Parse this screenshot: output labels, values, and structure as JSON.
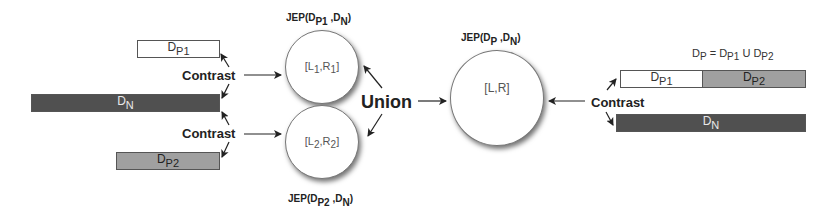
{
  "diagram": {
    "type": "process-flow",
    "left_datasets": {
      "dp1": {
        "base": "D",
        "sub": "P1",
        "fill": "#ffffff"
      },
      "dn": {
        "base": "D",
        "sub": "N",
        "fill": "#4a4a4a"
      },
      "dp2": {
        "base": "D",
        "sub": "P2",
        "fill": "#a9a9a9"
      }
    },
    "contrast_top": "Contrast",
    "contrast_bottom": "Contrast",
    "contrast_right": "Contrast",
    "union": "Union",
    "circles": {
      "c1": {
        "jep_prefix": "JEP(D",
        "jep_sub1": "P1",
        "jep_mid": " ,D",
        "jep_sub2": "N",
        "jep_suffix": ")",
        "inner_l": "[L",
        "inner_l_sub": "1",
        "inner_mid": ",R",
        "inner_r_sub": "1",
        "inner_end": "]"
      },
      "c2": {
        "jep_prefix": "JEP(D",
        "jep_sub1": "P2",
        "jep_mid": " ,D",
        "jep_sub2": "N",
        "jep_suffix": ")",
        "inner_l": "[L",
        "inner_l_sub": "2",
        "inner_mid": ",R",
        "inner_r_sub": "2",
        "inner_end": "]"
      },
      "c3": {
        "jep_prefix": "JEP(D",
        "jep_sub1": "P",
        "jep_mid": " ,D",
        "jep_sub2": "N",
        "jep_suffix": ")",
        "inner": "[L,R]"
      }
    },
    "formula": {
      "lhs_base": "D",
      "lhs_sub": "P",
      "eq": " = D",
      "a_sub": "P1",
      "union_op": " U D",
      "b_sub": "P2"
    },
    "right_datasets": {
      "dp1": {
        "base": "D",
        "sub": "P1",
        "fill": "#ffffff"
      },
      "dp2": {
        "base": "D",
        "sub": "P2",
        "fill": "#a9a9a9"
      },
      "dn": {
        "base": "D",
        "sub": "N",
        "fill": "#4a4a4a"
      }
    }
  }
}
